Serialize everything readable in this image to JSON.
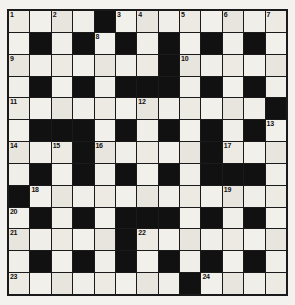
{
  "puzzle": {
    "title": "Crossword Grid",
    "columns": 13,
    "rows": 13,
    "colors": {
      "block": "#111111",
      "cell": "#eceae3",
      "border": "#1a1a1a",
      "page_background": "#f3f2ee",
      "number_text": "#111111"
    },
    "legend": {
      "block_label": "blocked-square",
      "open_label": "open-square"
    },
    "grid": [
      [
        "open",
        "open",
        "open",
        "open",
        "block",
        "open",
        "open",
        "open",
        "open",
        "open",
        "open",
        "open",
        "open"
      ],
      [
        "open",
        "block",
        "open",
        "block",
        "open",
        "block",
        "open",
        "block",
        "open",
        "block",
        "open",
        "block",
        "open"
      ],
      [
        "open",
        "open",
        "open",
        "open",
        "open",
        "open",
        "open",
        "block",
        "open",
        "open",
        "open",
        "open",
        "open"
      ],
      [
        "open",
        "block",
        "open",
        "block",
        "open",
        "block",
        "block",
        "block",
        "open",
        "block",
        "open",
        "block",
        "open"
      ],
      [
        "open",
        "open",
        "open",
        "open",
        "open",
        "open",
        "open",
        "open",
        "open",
        "open",
        "open",
        "open",
        "block"
      ],
      [
        "open",
        "block",
        "block",
        "block",
        "open",
        "block",
        "open",
        "block",
        "open",
        "block",
        "open",
        "block",
        "open"
      ],
      [
        "open",
        "open",
        "open",
        "block",
        "open",
        "open",
        "open",
        "open",
        "open",
        "block",
        "open",
        "open",
        "open"
      ],
      [
        "open",
        "block",
        "open",
        "block",
        "open",
        "block",
        "open",
        "block",
        "open",
        "block",
        "block",
        "block",
        "open"
      ],
      [
        "block",
        "open",
        "open",
        "open",
        "open",
        "open",
        "open",
        "open",
        "open",
        "open",
        "open",
        "open",
        "open"
      ],
      [
        "open",
        "block",
        "open",
        "block",
        "open",
        "block",
        "block",
        "block",
        "open",
        "block",
        "open",
        "block",
        "open"
      ],
      [
        "open",
        "open",
        "open",
        "open",
        "open",
        "block",
        "open",
        "open",
        "open",
        "open",
        "open",
        "open",
        "open"
      ],
      [
        "open",
        "block",
        "open",
        "block",
        "open",
        "block",
        "open",
        "block",
        "open",
        "block",
        "open",
        "block",
        "open"
      ],
      [
        "open",
        "open",
        "open",
        "open",
        "open",
        "open",
        "open",
        "open",
        "block",
        "open",
        "open",
        "open",
        "open"
      ]
    ],
    "numbers": [
      {
        "n": "1",
        "row": 0,
        "col": 0
      },
      {
        "n": "2",
        "row": 0,
        "col": 2
      },
      {
        "n": "3",
        "row": 0,
        "col": 5
      },
      {
        "n": "4",
        "row": 0,
        "col": 6
      },
      {
        "n": "5",
        "row": 0,
        "col": 8
      },
      {
        "n": "6",
        "row": 0,
        "col": 10
      },
      {
        "n": "7",
        "row": 0,
        "col": 12
      },
      {
        "n": "8",
        "row": 1,
        "col": 4
      },
      {
        "n": "9",
        "row": 2,
        "col": 0
      },
      {
        "n": "10",
        "row": 2,
        "col": 8
      },
      {
        "n": "11",
        "row": 4,
        "col": 0
      },
      {
        "n": "12",
        "row": 4,
        "col": 6
      },
      {
        "n": "13",
        "row": 5,
        "col": 12
      },
      {
        "n": "14",
        "row": 6,
        "col": 0
      },
      {
        "n": "15",
        "row": 6,
        "col": 2
      },
      {
        "n": "16",
        "row": 6,
        "col": 4
      },
      {
        "n": "17",
        "row": 6,
        "col": 10
      },
      {
        "n": "18",
        "row": 8,
        "col": 1
      },
      {
        "n": "19",
        "row": 8,
        "col": 10
      },
      {
        "n": "20",
        "row": 9,
        "col": 0
      },
      {
        "n": "21",
        "row": 10,
        "col": 0
      },
      {
        "n": "22",
        "row": 10,
        "col": 6
      },
      {
        "n": "23",
        "row": 12,
        "col": 0
      },
      {
        "n": "24",
        "row": 12,
        "col": 9
      }
    ]
  }
}
